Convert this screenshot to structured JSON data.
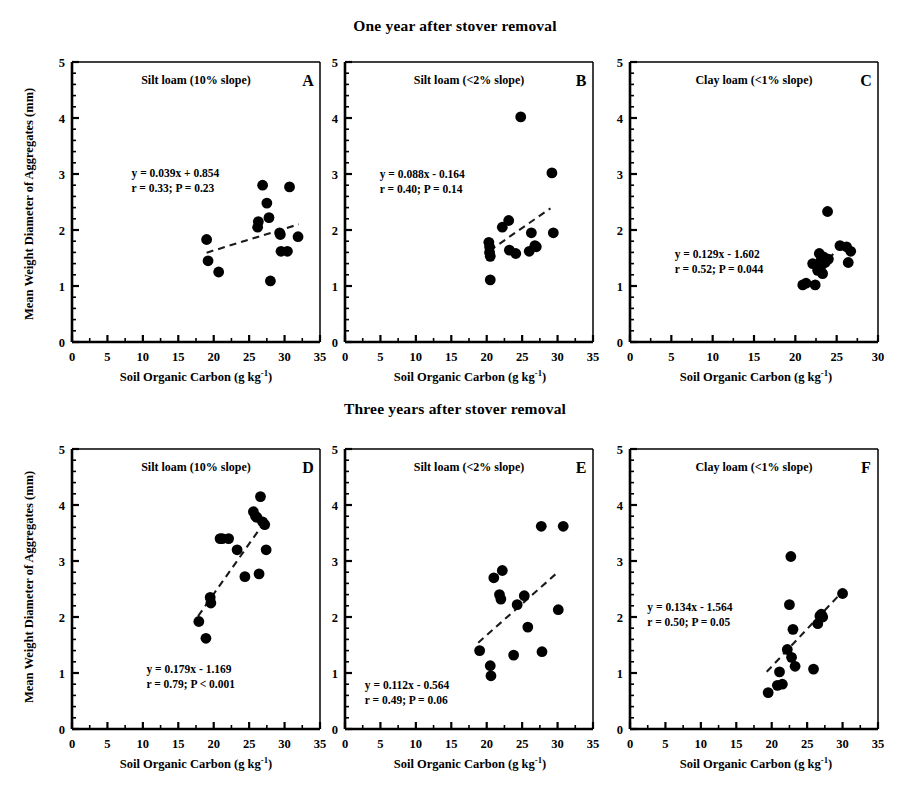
{
  "figure": {
    "title_top": "One year after stover removal",
    "title_bottom": "Three years after stover removal",
    "ylabel": "Mean Weight Diameter of Aggregates (mm)",
    "xlabel_main": "Soil Organic Carbon (g kg",
    "xlabel_sup": "-1",
    "xlabel_tail": ")",
    "marker_color": "#000000",
    "line_color": "#1a1a1a",
    "axis_color": "#000000"
  },
  "chart_data": [
    {
      "id": "A",
      "type": "scatter",
      "panel_letter": "A",
      "soil_label": "Silt loam (10% slope)",
      "title": "One year after stover removal",
      "xlabel": "Soil Organic Carbon (g kg-1)",
      "ylabel": "Mean Weight Diameter of Aggregates (mm)",
      "xlim": [
        0,
        35
      ],
      "ylim": [
        0,
        5
      ],
      "xticks": [
        0,
        5,
        10,
        15,
        20,
        25,
        30,
        35
      ],
      "yticks": [
        0,
        1,
        2,
        3,
        4,
        5
      ],
      "minor_ticks": true,
      "grid": false,
      "equation": "y = 0.039x + 0.854",
      "stats": "r = 0.33; P = 0.23",
      "slope": 0.039,
      "intercept": 0.854,
      "r": 0.33,
      "p": 0.23,
      "fit_xrange": [
        19.0,
        32.0
      ],
      "points": [
        [
          19.0,
          1.83
        ],
        [
          19.2,
          1.45
        ],
        [
          20.7,
          1.25
        ],
        [
          26.2,
          2.05
        ],
        [
          26.3,
          2.15
        ],
        [
          26.9,
          2.8
        ],
        [
          27.5,
          2.48
        ],
        [
          27.8,
          2.22
        ],
        [
          28.0,
          1.09
        ],
        [
          29.3,
          1.95
        ],
        [
          29.4,
          1.92
        ],
        [
          29.5,
          1.62
        ],
        [
          30.4,
          1.62
        ],
        [
          30.7,
          2.77
        ],
        [
          31.9,
          1.88
        ]
      ]
    },
    {
      "id": "B",
      "type": "scatter",
      "panel_letter": "B",
      "soil_label": "Silt loam (<2% slope)",
      "title": "One year after stover removal",
      "xlabel": "Soil Organic Carbon (g kg-1)",
      "ylabel": "Mean Weight Diameter of Aggregates (mm)",
      "xlim": [
        0,
        35
      ],
      "ylim": [
        0,
        5
      ],
      "xticks": [
        0,
        5,
        10,
        15,
        20,
        25,
        30,
        35
      ],
      "yticks": [
        0,
        1,
        2,
        3,
        4,
        5
      ],
      "minor_ticks": true,
      "grid": false,
      "equation": "y = 0.088x - 0.164",
      "stats": "r = 0.40; P = 0.14",
      "slope": 0.088,
      "intercept": -0.164,
      "r": 0.4,
      "p": 0.14,
      "fit_xrange": [
        20.4,
        29.0
      ],
      "points": [
        [
          20.3,
          1.78
        ],
        [
          20.4,
          1.7
        ],
        [
          20.4,
          1.6
        ],
        [
          20.5,
          1.53
        ],
        [
          20.5,
          1.11
        ],
        [
          22.2,
          2.05
        ],
        [
          23.1,
          2.17
        ],
        [
          23.2,
          1.64
        ],
        [
          24.1,
          1.58
        ],
        [
          24.8,
          4.02
        ],
        [
          26.0,
          1.62
        ],
        [
          26.3,
          1.95
        ],
        [
          26.8,
          1.72
        ],
        [
          27.0,
          1.7
        ],
        [
          29.2,
          3.02
        ],
        [
          29.4,
          1.95
        ]
      ]
    },
    {
      "id": "C",
      "type": "scatter",
      "panel_letter": "C",
      "soil_label": "Clay loam (<1% slope)",
      "title": "One year after stover removal",
      "xlabel": "Soil Organic Carbon (g kg-1)",
      "ylabel": "Mean Weight Diameter of Aggregates (mm)",
      "xlim": [
        0,
        30
      ],
      "ylim": [
        0,
        5
      ],
      "xticks": [
        0,
        5,
        10,
        15,
        20,
        25,
        30
      ],
      "yticks": [
        0,
        1,
        2,
        3,
        4,
        5
      ],
      "minor_ticks": true,
      "grid": false,
      "equation": "y = 0.129x - 1.602",
      "stats": "r = 0.52; P = 0.044",
      "slope": 0.129,
      "intercept": -1.602,
      "r": 0.52,
      "p": 0.044,
      "fit_xrange": [
        23.3,
        24.6
      ],
      "points": [
        [
          20.9,
          1.02
        ],
        [
          21.3,
          1.05
        ],
        [
          22.1,
          1.4
        ],
        [
          22.4,
          1.02
        ],
        [
          22.7,
          1.28
        ],
        [
          22.9,
          1.58
        ],
        [
          23.0,
          1.3
        ],
        [
          23.1,
          1.45
        ],
        [
          23.2,
          1.38
        ],
        [
          23.3,
          1.22
        ],
        [
          23.4,
          1.52
        ],
        [
          23.6,
          1.42
        ],
        [
          23.9,
          2.33
        ],
        [
          24.0,
          1.48
        ],
        [
          25.4,
          1.72
        ],
        [
          26.2,
          1.7
        ],
        [
          26.4,
          1.42
        ],
        [
          26.7,
          1.62
        ]
      ]
    },
    {
      "id": "D",
      "type": "scatter",
      "panel_letter": "D",
      "soil_label": "Silt loam (10% slope)",
      "title": "Three years after stover removal",
      "xlabel": "Soil Organic Carbon (g kg-1)",
      "ylabel": "Mean Weight Diameter of Aggregates (mm)",
      "xlim": [
        0,
        35
      ],
      "ylim": [
        0,
        5
      ],
      "xticks": [
        0,
        5,
        10,
        15,
        20,
        25,
        30,
        35
      ],
      "yticks": [
        0,
        1,
        2,
        3,
        4,
        5
      ],
      "minor_ticks": true,
      "grid": false,
      "equation": "y = 0.179x - 1.169",
      "stats": "r = 0.79; P < 0.001",
      "slope": 0.179,
      "intercept": -1.169,
      "r": 0.79,
      "p": 0.001,
      "fit_xrange": [
        17.8,
        26.8
      ],
      "points": [
        [
          17.9,
          1.92
        ],
        [
          18.9,
          1.62
        ],
        [
          19.5,
          2.35
        ],
        [
          19.6,
          2.25
        ],
        [
          20.9,
          3.4
        ],
        [
          21.2,
          3.4
        ],
        [
          22.1,
          3.4
        ],
        [
          23.3,
          3.2
        ],
        [
          24.4,
          2.72
        ],
        [
          25.6,
          3.88
        ],
        [
          25.9,
          3.8
        ],
        [
          26.1,
          3.78
        ],
        [
          26.4,
          2.77
        ],
        [
          26.6,
          4.15
        ],
        [
          26.9,
          3.7
        ],
        [
          27.2,
          3.65
        ],
        [
          27.4,
          3.2
        ]
      ]
    },
    {
      "id": "E",
      "type": "scatter",
      "panel_letter": "E",
      "soil_label": "Silt loam (<2% slope)",
      "title": "Three years after stover removal",
      "xlabel": "Soil Organic Carbon (g kg-1)",
      "ylabel": "Mean Weight Diameter of Aggregates (mm)",
      "xlim": [
        0,
        35
      ],
      "ylim": [
        0,
        5
      ],
      "xticks": [
        0,
        5,
        10,
        15,
        20,
        25,
        30,
        35
      ],
      "yticks": [
        0,
        1,
        2,
        3,
        4,
        5
      ],
      "minor_ticks": true,
      "grid": false,
      "equation": "y = 0.112x - 0.564",
      "stats": "r = 0.49; P = 0.06",
      "slope": 0.112,
      "intercept": -0.564,
      "r": 0.49,
      "p": 0.06,
      "fit_xrange": [
        18.8,
        30.2
      ],
      "points": [
        [
          19.0,
          1.4
        ],
        [
          20.5,
          1.13
        ],
        [
          20.6,
          0.95
        ],
        [
          21.0,
          2.7
        ],
        [
          21.8,
          2.4
        ],
        [
          22.0,
          2.32
        ],
        [
          22.2,
          2.83
        ],
        [
          23.8,
          1.32
        ],
        [
          24.3,
          2.22
        ],
        [
          25.3,
          2.38
        ],
        [
          25.8,
          1.82
        ],
        [
          27.7,
          3.62
        ],
        [
          27.8,
          1.38
        ],
        [
          30.1,
          2.13
        ],
        [
          30.8,
          3.62
        ]
      ]
    },
    {
      "id": "F",
      "type": "scatter",
      "panel_letter": "F",
      "soil_label": "Clay loam (<1% slope)",
      "title": "Three years after stover removal",
      "xlabel": "Soil Organic Carbon (g kg-1)",
      "ylabel": "Mean Weight Diameter of Aggregates (mm)",
      "xlim": [
        0,
        35
      ],
      "ylim": [
        0,
        5
      ],
      "xticks": [
        0,
        5,
        10,
        15,
        20,
        25,
        30,
        35
      ],
      "yticks": [
        0,
        1,
        2,
        3,
        4,
        5
      ],
      "minor_ticks": true,
      "grid": false,
      "equation": "y = 0.134x - 1.564",
      "stats": "r = 0.50; P = 0.05",
      "slope": 0.134,
      "intercept": -1.564,
      "r": 0.5,
      "p": 0.05,
      "fit_xrange": [
        19.3,
        29.5
      ],
      "points": [
        [
          19.5,
          0.65
        ],
        [
          20.8,
          0.78
        ],
        [
          21.1,
          1.02
        ],
        [
          21.5,
          0.8
        ],
        [
          22.2,
          1.42
        ],
        [
          22.5,
          2.22
        ],
        [
          22.7,
          3.08
        ],
        [
          22.8,
          1.28
        ],
        [
          23.0,
          1.78
        ],
        [
          23.3,
          1.12
        ],
        [
          25.9,
          1.07
        ],
        [
          26.5,
          1.88
        ],
        [
          26.8,
          2.02
        ],
        [
          27.0,
          2.05
        ],
        [
          27.2,
          2.0
        ],
        [
          30.0,
          2.42
        ]
      ]
    }
  ]
}
